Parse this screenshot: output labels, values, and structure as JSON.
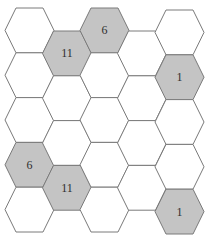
{
  "diagram": {
    "type": "hexagonal-grid",
    "columns": [
      {
        "column": 1,
        "cells": [
          "",
          "",
          "",
          "6",
          ""
        ]
      },
      {
        "column": 2,
        "cells": [
          "11",
          "",
          "",
          "11"
        ]
      },
      {
        "column": 3,
        "cells": [
          "6",
          "",
          "",
          "",
          ""
        ]
      },
      {
        "column": 4,
        "cells": [
          "",
          "",
          "",
          ""
        ]
      },
      {
        "column": 5,
        "cells": [
          "",
          "1",
          "",
          "",
          "1"
        ]
      }
    ],
    "colors": {
      "filled": "#c4c4c4",
      "empty": "#ffffff",
      "stroke": "#7a7a7a",
      "label": "#2e2e2e"
    }
  }
}
